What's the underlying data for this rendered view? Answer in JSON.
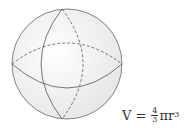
{
  "diagram": {
    "shape": "sphere",
    "colors": {
      "stroke": "#555555",
      "fill": "#f2f2f2",
      "shade": "#e6e6e6"
    }
  },
  "formula": {
    "lhs": "V",
    "eq": "=",
    "frac_num": "4",
    "frac_den": "3",
    "pi_r": "πr",
    "exp": "3"
  }
}
